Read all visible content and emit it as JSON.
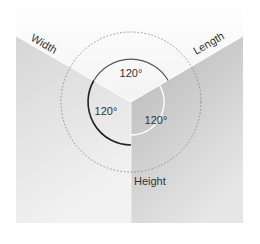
{
  "diagram": {
    "title": "",
    "axes": {
      "width_label": "Width",
      "length_label": "Length",
      "height_label": "Height"
    },
    "angles": {
      "top": "120°",
      "left": "120°",
      "right": "120°"
    },
    "colors": {
      "background": "#ffffff",
      "top_face": "#f6f6f6",
      "left_face_start": "#d8d8d8",
      "left_face_end": "#f0f0f0",
      "right_face_start": "#b9b9b9",
      "right_face_end": "#e4e4e4",
      "dotted_circle": "#8a8a8a",
      "dark_arc": "#222222",
      "light_arc": "#ffffff",
      "top_arc": "#555555",
      "text": "#333333"
    }
  }
}
